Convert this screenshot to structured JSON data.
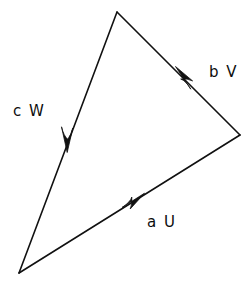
{
  "figure": {
    "kind": "vector-triangle-diagram",
    "background_color": "#ffffff",
    "stroke_color": "#111111",
    "text_color": "#0d0d0d",
    "stroke_width": 1.6,
    "width": 251,
    "height": 286
  },
  "labels": {
    "side_left": "c W",
    "side_right": "b V",
    "side_bottom": "a U"
  },
  "chart_data": {
    "type": "diagram",
    "title": "",
    "xlabel": "",
    "ylabel": "",
    "vertices": [
      {
        "name": "top",
        "x": 117,
        "y": 12
      },
      {
        "name": "right",
        "x": 240,
        "y": 135
      },
      {
        "name": "bottom-left",
        "x": 19,
        "y": 273
      }
    ],
    "edges": [
      {
        "name": "aU",
        "label": "a U",
        "from": "bottom-left",
        "to": "right",
        "x1": 19,
        "y1": 273,
        "x2": 240,
        "y2": 135,
        "arrow_at": {
          "x": 143,
          "y": 195
        },
        "direction": "up-right"
      },
      {
        "name": "bV",
        "label": "b V",
        "from": "right",
        "to": "top",
        "x1": 240,
        "y1": 135,
        "x2": 117,
        "y2": 12,
        "arrow_at": {
          "x": 174,
          "y": 68
        },
        "direction": "up-left"
      },
      {
        "name": "cW",
        "label": "c W",
        "from": "top",
        "to": "bottom-left",
        "x1": 117,
        "y1": 12,
        "x2": 19,
        "y2": 273,
        "arrow_at": {
          "x": 68,
          "y": 151
        },
        "direction": "down-left"
      }
    ]
  }
}
